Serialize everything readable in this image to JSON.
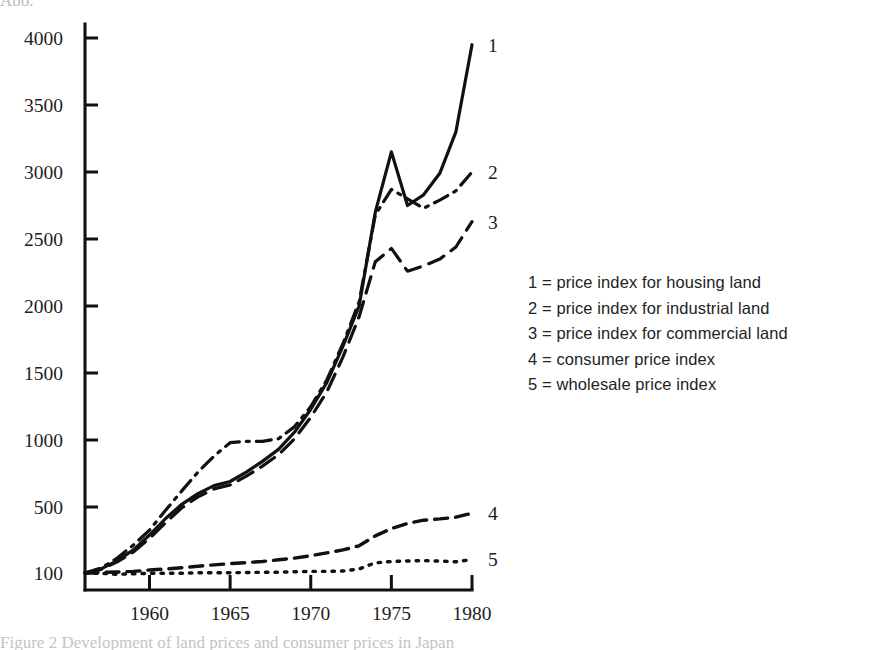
{
  "figure": {
    "background_color": "#ffffff",
    "ink_color": "#111111",
    "top_cropped_fragment": "Abb.",
    "bottom_cropped_fragment": "Figure 2 Development of land prices and consumer prices in Japan"
  },
  "axes": {
    "y_ticks": [
      "100",
      "500",
      "1000",
      "1500",
      "2000",
      "2500",
      "3000",
      "3500",
      "4000"
    ],
    "x_ticks": [
      "1960",
      "1965",
      "1970",
      "1975",
      "1980"
    ]
  },
  "series_tags": [
    "1",
    "2",
    "3",
    "4",
    "5"
  ],
  "legend": {
    "entries": [
      "1 = price index for housing land",
      "2 = price index for industrial land",
      "3 = price index for commercial land",
      "4 = consumer price index",
      "5 = wholesale price index"
    ]
  },
  "chart_data": {
    "type": "line",
    "title": "",
    "xlabel": "",
    "ylabel": "",
    "xlim": [
      1956,
      1980
    ],
    "ylim": [
      100,
      4000
    ],
    "y_tick_values": [
      100,
      500,
      1000,
      1500,
      2000,
      2500,
      3000,
      3500,
      4000
    ],
    "x_tick_values": [
      1960,
      1965,
      1970,
      1975,
      1980
    ],
    "grid": false,
    "legend_position": "right",
    "x": [
      1956,
      1957,
      1958,
      1959,
      1960,
      1961,
      1962,
      1963,
      1964,
      1965,
      1966,
      1967,
      1968,
      1969,
      1970,
      1971,
      1972,
      1973,
      1974,
      1975,
      1976,
      1977,
      1978,
      1979,
      1980
    ],
    "series": [
      {
        "name": "price index for housing land",
        "tag": "1",
        "line_style": "solid",
        "values": [
          100,
          125,
          175,
          240,
          330,
          430,
          520,
          600,
          660,
          690,
          760,
          840,
          930,
          1060,
          1230,
          1430,
          1700,
          2000,
          2700,
          3150,
          2750,
          2830,
          2990,
          3300,
          3950
        ]
      },
      {
        "name": "price index for industrial land",
        "tag": "2",
        "line_style": "dash-dot",
        "values": [
          100,
          130,
          190,
          270,
          360,
          480,
          620,
          760,
          880,
          980,
          990,
          990,
          1010,
          1100,
          1250,
          1450,
          1720,
          2030,
          2680,
          2870,
          2800,
          2730,
          2790,
          2860,
          3000
        ]
      },
      {
        "name": "price index for commercial land",
        "tag": "3",
        "line_style": "long-dash",
        "values": [
          100,
          122,
          168,
          228,
          310,
          405,
          495,
          575,
          635,
          665,
          730,
          805,
          890,
          1010,
          1170,
          1360,
          1620,
          1920,
          2330,
          2430,
          2260,
          2300,
          2350,
          2440,
          2630
        ]
      },
      {
        "name": "consumer price index",
        "tag": "4",
        "line_style": "medium-dash",
        "values": [
          100,
          104,
          106,
          110,
          118,
          124,
          132,
          141,
          149,
          157,
          163,
          170,
          180,
          190,
          205,
          222,
          240,
          265,
          325,
          370,
          400,
          420,
          428,
          438,
          462
        ]
      },
      {
        "name": "wholesale price index",
        "tag": "5",
        "line_style": "dotted",
        "values": [
          100,
          98,
          92,
          95,
          98,
          99,
          99,
          101,
          101,
          102,
          103,
          104,
          105,
          107,
          110,
          110,
          112,
          124,
          162,
          170,
          173,
          175,
          172,
          168,
          182
        ]
      }
    ]
  }
}
